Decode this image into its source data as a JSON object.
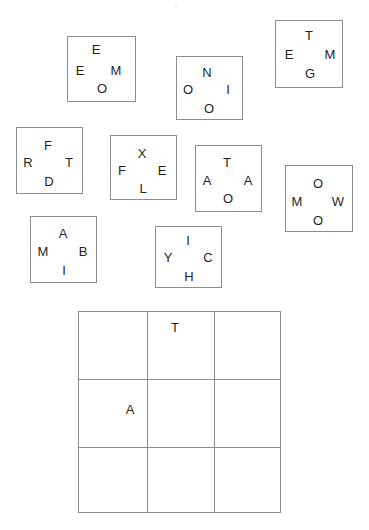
{
  "canvas": {
    "width": 369,
    "height": 530,
    "background": "#ffffff"
  },
  "style": {
    "border_color": "#8c8c8c",
    "letter_color": "#1f1f1f",
    "letter_font_size_px": 13
  },
  "top_speck": {
    "x": 175,
    "y": 3
  },
  "letter_boxes": [
    {
      "id": "box-1",
      "x": 67,
      "y": 36,
      "width": 69,
      "height": 66,
      "letters": [
        {
          "char": "E",
          "x": 96,
          "y": 49
        },
        {
          "char": "E",
          "x": 80,
          "y": 70
        },
        {
          "char": "M",
          "x": 116,
          "y": 70
        },
        {
          "char": "O",
          "x": 102,
          "y": 88
        }
      ]
    },
    {
      "id": "box-2",
      "x": 176,
      "y": 56,
      "width": 67,
      "height": 64,
      "letters": [
        {
          "char": "N",
          "x": 207,
          "y": 72
        },
        {
          "char": "O",
          "x": 188,
          "y": 89
        },
        {
          "char": "I",
          "x": 228,
          "y": 89
        },
        {
          "char": "O",
          "x": 209,
          "y": 108
        }
      ]
    },
    {
      "id": "box-3",
      "x": 275,
      "y": 20,
      "width": 68,
      "height": 68,
      "letters": [
        {
          "char": "T",
          "x": 309,
          "y": 35
        },
        {
          "char": "E",
          "x": 289,
          "y": 54
        },
        {
          "char": "M",
          "x": 330,
          "y": 54
        },
        {
          "char": "G",
          "x": 310,
          "y": 73
        }
      ]
    },
    {
      "id": "box-4",
      "x": 16,
      "y": 127,
      "width": 67,
      "height": 67,
      "letters": [
        {
          "char": "F",
          "x": 48,
          "y": 145
        },
        {
          "char": "R",
          "x": 28,
          "y": 162
        },
        {
          "char": "T",
          "x": 69,
          "y": 162
        },
        {
          "char": "D",
          "x": 49,
          "y": 181
        }
      ]
    },
    {
      "id": "box-5",
      "x": 110,
      "y": 135,
      "width": 67,
      "height": 65,
      "letters": [
        {
          "char": "X",
          "x": 142,
          "y": 153
        },
        {
          "char": "F",
          "x": 122,
          "y": 170
        },
        {
          "char": "E",
          "x": 162,
          "y": 170
        },
        {
          "char": "L",
          "x": 143,
          "y": 188
        }
      ]
    },
    {
      "id": "box-6",
      "x": 195,
      "y": 145,
      "width": 67,
      "height": 67,
      "letters": [
        {
          "char": "T",
          "x": 227,
          "y": 162
        },
        {
          "char": "A",
          "x": 207,
          "y": 180
        },
        {
          "char": "A",
          "x": 248,
          "y": 180
        },
        {
          "char": "O",
          "x": 228,
          "y": 198
        }
      ]
    },
    {
      "id": "box-7",
      "x": 285,
      "y": 165,
      "width": 68,
      "height": 67,
      "letters": [
        {
          "char": "O",
          "x": 318,
          "y": 183
        },
        {
          "char": "M",
          "x": 297,
          "y": 201
        },
        {
          "char": "W",
          "x": 338,
          "y": 201
        },
        {
          "char": "O",
          "x": 318,
          "y": 220
        }
      ]
    },
    {
      "id": "box-8",
      "x": 30,
      "y": 216,
      "width": 67,
      "height": 67,
      "letters": [
        {
          "char": "A",
          "x": 63,
          "y": 233
        },
        {
          "char": "M",
          "x": 43,
          "y": 251
        },
        {
          "char": "B",
          "x": 83,
          "y": 251
        },
        {
          "char": "I",
          "x": 64,
          "y": 270
        }
      ]
    },
    {
      "id": "box-9",
      "x": 155,
      "y": 226,
      "width": 67,
      "height": 62,
      "letters": [
        {
          "char": "I",
          "x": 188,
          "y": 240
        },
        {
          "char": "Y",
          "x": 168,
          "y": 257
        },
        {
          "char": "C",
          "x": 208,
          "y": 257
        },
        {
          "char": "H",
          "x": 189,
          "y": 276
        }
      ]
    }
  ],
  "answer_grid": {
    "x": 78,
    "y": 311,
    "width": 203,
    "height": 202,
    "rows": 3,
    "columns": 3,
    "cells": [
      {
        "row": 0,
        "col": 0,
        "char": ""
      },
      {
        "row": 0,
        "col": 1,
        "char": "T"
      },
      {
        "row": 0,
        "col": 2,
        "char": ""
      },
      {
        "row": 1,
        "col": 0,
        "char": "A"
      },
      {
        "row": 1,
        "col": 1,
        "char": ""
      },
      {
        "row": 1,
        "col": 2,
        "char": ""
      },
      {
        "row": 2,
        "col": 0,
        "char": ""
      },
      {
        "row": 2,
        "col": 1,
        "char": ""
      },
      {
        "row": 2,
        "col": 2,
        "char": ""
      }
    ],
    "filled_letters": [
      {
        "char": "T",
        "x": 175,
        "y": 327
      },
      {
        "char": "A",
        "x": 130,
        "y": 409
      }
    ]
  }
}
